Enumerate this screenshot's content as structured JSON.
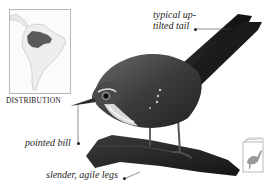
{
  "distribution": {
    "label": "DISTRIBUTION",
    "map_icon": "south-america-map-icon",
    "range_color": "#5a5a5a",
    "land_color": "#eeeeee"
  },
  "annotations": {
    "tail": {
      "line1": "typical up-",
      "line2": "tilted tail"
    },
    "bill": {
      "label": "pointed bill"
    },
    "legs": {
      "label": "slender, agile legs"
    }
  },
  "subject": {
    "icon": "bird-photo",
    "perch_icon": "branch"
  },
  "corner_icon": {
    "icon": "field-guide-book-icon",
    "color": "#9a9a9a"
  }
}
